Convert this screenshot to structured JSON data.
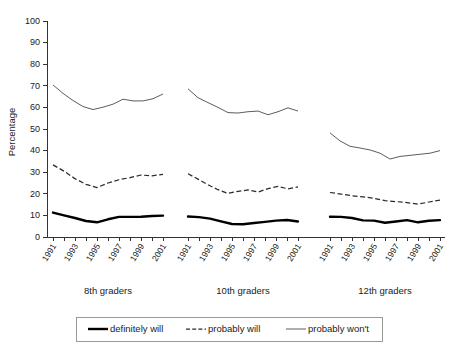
{
  "chart_data": {
    "type": "line",
    "title": "",
    "subtitle": "",
    "xlabel": "",
    "ylabel": "Percentage",
    "ylim": [
      0,
      100
    ],
    "ytick_step": 10,
    "yticks": [
      0,
      10,
      20,
      30,
      40,
      50,
      60,
      70,
      80,
      90,
      100
    ],
    "grid": false,
    "legend_position": "bottom",
    "x": [
      1991,
      1992,
      1993,
      1994,
      1995,
      1996,
      1997,
      1998,
      1999,
      2000,
      2001
    ],
    "xtick_labels": [
      "1991",
      "",
      "1993",
      "",
      "1995",
      "",
      "1997",
      "",
      "1999",
      "",
      "2001"
    ],
    "panels": [
      {
        "name": "8th graders",
        "series": [
          {
            "name": "definitely will",
            "style": "thick-solid",
            "values": [
              11.3,
              10.0,
              8.8,
              7.4,
              6.8,
              8.2,
              9.3,
              9.3,
              9.4,
              9.7,
              9.9
            ]
          },
          {
            "name": "probably will",
            "style": "dashed",
            "values": [
              33.4,
              30.5,
              27.0,
              24.4,
              22.9,
              25.0,
              26.5,
              27.5,
              28.7,
              28.3,
              29.0
            ]
          },
          {
            "name": "probably won't",
            "style": "thin-solid",
            "values": [
              70.4,
              66.5,
              63.2,
              60.4,
              59.0,
              60.1,
              61.5,
              63.8,
              63.0,
              63.0,
              64.0,
              66.2
            ]
          }
        ]
      },
      {
        "name": "10th graders",
        "series": [
          {
            "name": "definitely will",
            "style": "thick-solid",
            "values": [
              9.5,
              9.2,
              8.5,
              7.2,
              6.0,
              5.9,
              6.5,
              7.0,
              7.6,
              7.9,
              7.2
            ]
          },
          {
            "name": "probably will",
            "style": "dashed",
            "values": [
              29.3,
              26.8,
              24.2,
              21.9,
              20.2,
              21.1,
              21.8,
              20.8,
              22.4,
              23.4,
              22.3,
              23.2
            ]
          },
          {
            "name": "probably won't",
            "style": "thin-solid",
            "values": [
              68.6,
              64.5,
              62.2,
              60.0,
              57.6,
              57.4,
              58.0,
              58.3,
              56.6,
              58.0,
              59.8,
              58.3
            ]
          }
        ]
      },
      {
        "name": "12th graders",
        "series": [
          {
            "name": "definitely will",
            "style": "thick-solid",
            "values": [
              9.4,
              9.3,
              8.8,
              7.7,
              7.6,
              6.6,
              7.2,
              7.8,
              6.8,
              7.5,
              7.8
            ]
          },
          {
            "name": "probably will",
            "style": "dashed",
            "values": [
              20.6,
              19.9,
              19.1,
              18.6,
              17.9,
              16.8,
              16.4,
              15.9,
              15.2,
              16.2,
              17.1
            ]
          },
          {
            "name": "probably won't",
            "style": "thin-solid",
            "values": [
              48.2,
              44.5,
              42.0,
              41.2,
              40.3,
              38.8,
              36.1,
              37.3,
              37.8,
              38.3,
              38.8,
              40.0
            ]
          }
        ]
      }
    ],
    "legend": [
      {
        "label": "definitely will",
        "style": "thick-solid"
      },
      {
        "label": "probably will",
        "style": "dashed"
      },
      {
        "label": "probably won't",
        "style": "thin-solid"
      }
    ]
  }
}
